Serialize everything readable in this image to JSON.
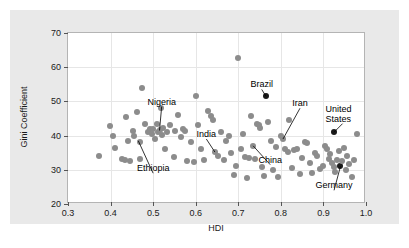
{
  "chart_data": {
    "type": "scatter",
    "title": "",
    "xlabel": "HDI",
    "ylabel": "Gini Coefficient",
    "xlim": [
      0.3,
      1.0
    ],
    "ylim": [
      20,
      70
    ],
    "xticks": [
      "0.3",
      "0.4",
      "0.5",
      "0.6",
      "0.7",
      "0.8",
      "0.9",
      "1.0"
    ],
    "yticks": [
      "20",
      "30",
      "40",
      "50",
      "60",
      "70"
    ],
    "grid": true,
    "legend": "none",
    "marker_color": "#8c8c8c",
    "highlight_color": "#1a1a1a",
    "panel_color": "#e9e9e9",
    "plot_background": "#ffffff",
    "annotations": [
      {
        "label": "Nigeria",
        "x": 0.52,
        "y": 48.5,
        "point_x": 0.515,
        "point_y": 41.5
      },
      {
        "label": "Ethiopia",
        "x": 0.5,
        "y": 29.0,
        "point_x": 0.465,
        "point_y": 38.5
      },
      {
        "label": "India",
        "x": 0.625,
        "y": 39.0,
        "point_x": 0.645,
        "point_y": 35.2
      },
      {
        "label": "Brazil",
        "x": 0.755,
        "y": 53.5,
        "point_x": 0.765,
        "point_y": 51.5
      },
      {
        "label": "China",
        "x": 0.775,
        "y": 31.5,
        "point_x": 0.735,
        "point_y": 37.0
      },
      {
        "label": "Iran",
        "x": 0.845,
        "y": 48.0,
        "point_x": 0.805,
        "point_y": 39.0
      },
      {
        "label": "United States",
        "x": 0.945,
        "y": 43.5,
        "point_x": 0.925,
        "point_y": 41.0
      },
      {
        "label": "Germany",
        "x": 0.925,
        "y": 24.0,
        "point_x": 0.94,
        "point_y": 31.0
      }
    ],
    "points": [
      {
        "x": 0.372,
        "y": 34.0
      },
      {
        "x": 0.398,
        "y": 42.8
      },
      {
        "x": 0.405,
        "y": 39.8
      },
      {
        "x": 0.41,
        "y": 36.5
      },
      {
        "x": 0.428,
        "y": 33.2
      },
      {
        "x": 0.433,
        "y": 33.0
      },
      {
        "x": 0.436,
        "y": 45.5
      },
      {
        "x": 0.44,
        "y": 38.3
      },
      {
        "x": 0.446,
        "y": 32.5
      },
      {
        "x": 0.452,
        "y": 41.2
      },
      {
        "x": 0.456,
        "y": 40.0
      },
      {
        "x": 0.462,
        "y": 46.8
      },
      {
        "x": 0.468,
        "y": 38.2
      },
      {
        "x": 0.47,
        "y": 33.2
      },
      {
        "x": 0.474,
        "y": 54.0
      },
      {
        "x": 0.482,
        "y": 43.5
      },
      {
        "x": 0.488,
        "y": 41.0
      },
      {
        "x": 0.492,
        "y": 42.0
      },
      {
        "x": 0.497,
        "y": 40.5
      },
      {
        "x": 0.5,
        "y": 41.8
      },
      {
        "x": 0.504,
        "y": 39.0
      },
      {
        "x": 0.508,
        "y": 43.3
      },
      {
        "x": 0.511,
        "y": 41.0
      },
      {
        "x": 0.515,
        "y": 41.5
      },
      {
        "x": 0.518,
        "y": 48.0
      },
      {
        "x": 0.521,
        "y": 40.3
      },
      {
        "x": 0.524,
        "y": 42.2
      },
      {
        "x": 0.528,
        "y": 36.0
      },
      {
        "x": 0.533,
        "y": 41.0
      },
      {
        "x": 0.54,
        "y": 43.0
      },
      {
        "x": 0.548,
        "y": 33.8
      },
      {
        "x": 0.552,
        "y": 41.2
      },
      {
        "x": 0.558,
        "y": 46.0
      },
      {
        "x": 0.565,
        "y": 39.5
      },
      {
        "x": 0.57,
        "y": 42.0
      },
      {
        "x": 0.574,
        "y": 41.3
      },
      {
        "x": 0.58,
        "y": 32.5
      },
      {
        "x": 0.59,
        "y": 38.0
      },
      {
        "x": 0.596,
        "y": 32.2
      },
      {
        "x": 0.6,
        "y": 51.5
      },
      {
        "x": 0.605,
        "y": 43.0
      },
      {
        "x": 0.612,
        "y": 36.2
      },
      {
        "x": 0.62,
        "y": 33.0
      },
      {
        "x": 0.628,
        "y": 47.2
      },
      {
        "x": 0.636,
        "y": 45.8
      },
      {
        "x": 0.64,
        "y": 44.5
      },
      {
        "x": 0.645,
        "y": 35.2
      },
      {
        "x": 0.652,
        "y": 34.0
      },
      {
        "x": 0.66,
        "y": 41.0
      },
      {
        "x": 0.666,
        "y": 32.8
      },
      {
        "x": 0.672,
        "y": 38.5
      },
      {
        "x": 0.678,
        "y": 40.0
      },
      {
        "x": 0.684,
        "y": 34.8
      },
      {
        "x": 0.69,
        "y": 28.5
      },
      {
        "x": 0.695,
        "y": 31.0
      },
      {
        "x": 0.7,
        "y": 62.8
      },
      {
        "x": 0.706,
        "y": 36.0
      },
      {
        "x": 0.71,
        "y": 40.5
      },
      {
        "x": 0.716,
        "y": 33.8
      },
      {
        "x": 0.72,
        "y": 27.5
      },
      {
        "x": 0.724,
        "y": 33.5
      },
      {
        "x": 0.73,
        "y": 45.8
      },
      {
        "x": 0.735,
        "y": 37.0
      },
      {
        "x": 0.74,
        "y": 33.2
      },
      {
        "x": 0.745,
        "y": 43.5
      },
      {
        "x": 0.748,
        "y": 43.0
      },
      {
        "x": 0.752,
        "y": 42.2
      },
      {
        "x": 0.756,
        "y": 30.8
      },
      {
        "x": 0.76,
        "y": 28.2
      },
      {
        "x": 0.765,
        "y": 51.5,
        "highlight": true
      },
      {
        "x": 0.77,
        "y": 44.0
      },
      {
        "x": 0.776,
        "y": 38.5
      },
      {
        "x": 0.782,
        "y": 30.0
      },
      {
        "x": 0.788,
        "y": 36.8
      },
      {
        "x": 0.794,
        "y": 27.8
      },
      {
        "x": 0.8,
        "y": 39.8
      },
      {
        "x": 0.805,
        "y": 39.0
      },
      {
        "x": 0.81,
        "y": 36.0
      },
      {
        "x": 0.816,
        "y": 35.2
      },
      {
        "x": 0.82,
        "y": 44.5
      },
      {
        "x": 0.826,
        "y": 30.5
      },
      {
        "x": 0.832,
        "y": 35.8
      },
      {
        "x": 0.838,
        "y": 36.0
      },
      {
        "x": 0.844,
        "y": 28.8
      },
      {
        "x": 0.85,
        "y": 33.5
      },
      {
        "x": 0.856,
        "y": 38.2
      },
      {
        "x": 0.862,
        "y": 37.8
      },
      {
        "x": 0.868,
        "y": 32.0
      },
      {
        "x": 0.874,
        "y": 29.0
      },
      {
        "x": 0.88,
        "y": 35.0
      },
      {
        "x": 0.886,
        "y": 34.0
      },
      {
        "x": 0.892,
        "y": 30.2
      },
      {
        "x": 0.898,
        "y": 31.2
      },
      {
        "x": 0.904,
        "y": 37.0
      },
      {
        "x": 0.908,
        "y": 36.2
      },
      {
        "x": 0.912,
        "y": 33.2
      },
      {
        "x": 0.916,
        "y": 34.5
      },
      {
        "x": 0.92,
        "y": 32.0
      },
      {
        "x": 0.924,
        "y": 30.8
      },
      {
        "x": 0.925,
        "y": 41.0,
        "highlight": true
      },
      {
        "x": 0.928,
        "y": 29.5
      },
      {
        "x": 0.932,
        "y": 33.0
      },
      {
        "x": 0.936,
        "y": 35.5
      },
      {
        "x": 0.94,
        "y": 31.0,
        "highlight": true
      },
      {
        "x": 0.944,
        "y": 32.5
      },
      {
        "x": 0.948,
        "y": 36.5
      },
      {
        "x": 0.952,
        "y": 30.0
      },
      {
        "x": 0.956,
        "y": 34.0
      },
      {
        "x": 0.96,
        "y": 31.8
      },
      {
        "x": 0.966,
        "y": 28.0
      },
      {
        "x": 0.972,
        "y": 33.0
      },
      {
        "x": 0.978,
        "y": 40.5
      }
    ]
  }
}
